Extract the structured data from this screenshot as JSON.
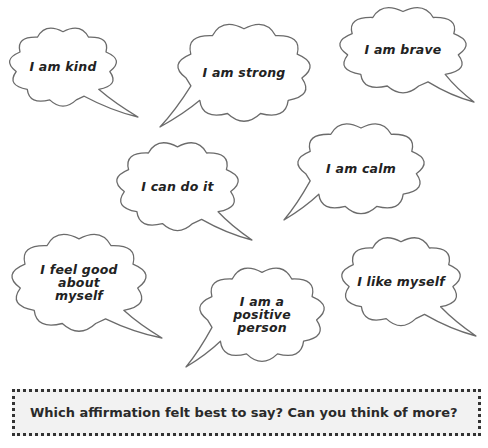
{
  "affirmations": [
    {
      "text": "I am kind",
      "box": [
        8,
        23,
        110,
        87
      ],
      "tail": [
        138,
        117
      ]
    },
    {
      "text": "I am strong",
      "box": [
        176,
        18,
        136,
        108
      ],
      "tail": [
        160,
        127
      ]
    },
    {
      "text": "I am brave",
      "box": [
        338,
        2,
        130,
        95
      ],
      "tail": [
        474,
        102
      ]
    },
    {
      "text": "I can do it",
      "box": [
        115,
        137,
        125,
        98
      ],
      "tail": [
        252,
        240
      ]
    },
    {
      "text": "I am calm",
      "box": [
        296,
        118,
        130,
        100
      ],
      "tail": [
        284,
        220
      ]
    },
    {
      "text": "I feel good\nabout\nmyself",
      "box": [
        10,
        228,
        138,
        108
      ],
      "tail": [
        162,
        338
      ]
    },
    {
      "text": "I am a\npositive\nperson",
      "box": [
        198,
        262,
        128,
        104
      ],
      "tail": [
        186,
        367
      ]
    },
    {
      "text": "I like myself",
      "box": [
        340,
        232,
        122,
        98
      ],
      "tail": [
        476,
        336
      ]
    }
  ],
  "prompt": {
    "text": "Which affirmation felt best to say? Can you think of more?"
  },
  "colors": {
    "outline": "#6b6b6b",
    "prompt_bg": "#f2f2f2",
    "prompt_border": "#333333"
  }
}
